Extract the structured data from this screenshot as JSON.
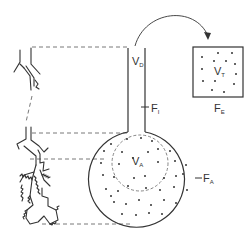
{
  "diagram": {
    "type": "lung-airway-model",
    "labels": {
      "dead_space_volume": {
        "main": "V",
        "sub": "D"
      },
      "inspired_fraction": {
        "main": "F",
        "sub": "I"
      },
      "alveolar_volume": {
        "main": "V",
        "sub": "A"
      },
      "alveolar_fraction": {
        "main": "F",
        "sub": "A"
      },
      "tidal_volume": {
        "main": "V",
        "sub": "T"
      },
      "expired_fraction": {
        "main": "F",
        "sub": "E"
      }
    },
    "colors": {
      "stroke": "#333333",
      "dash": "#555555",
      "background": "#ffffff"
    }
  }
}
